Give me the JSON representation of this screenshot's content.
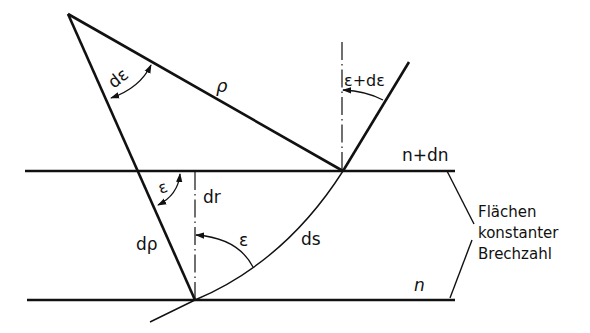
{
  "diagram": {
    "type": "ray-refraction-geometry",
    "labels": {
      "d_epsilon": "dε",
      "rho": "ρ",
      "epsilon_plus_d_epsilon": "ε+dε",
      "n_plus_dn": "n+dn",
      "epsilon_upper": "ε",
      "dr": "dr",
      "d_rho": "dρ",
      "epsilon_lower": "ε",
      "ds": "ds",
      "n": "n",
      "surfaces_line1": "Flächen",
      "surfaces_line2": "konstanter",
      "surfaces_line3": "Brechzahl"
    },
    "colors": {
      "line": "#111111",
      "background": "#ffffff"
    }
  }
}
